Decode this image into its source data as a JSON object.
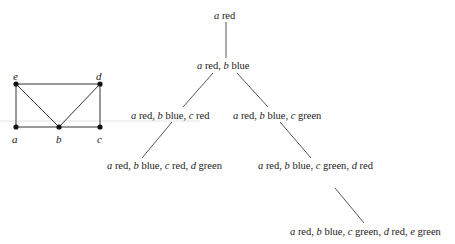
{
  "graph": {
    "vertices": [
      {
        "id": "e",
        "label": "e",
        "x": 16,
        "y": 84
      },
      {
        "id": "d",
        "label": "d",
        "x": 100,
        "y": 84
      },
      {
        "id": "a",
        "label": "a",
        "x": 16,
        "y": 127
      },
      {
        "id": "b",
        "label": "b",
        "x": 59,
        "y": 127
      },
      {
        "id": "c",
        "label": "c",
        "x": 100,
        "y": 127
      }
    ],
    "edges": [
      [
        "e",
        "d"
      ],
      [
        "e",
        "a"
      ],
      [
        "e",
        "b"
      ],
      [
        "d",
        "b"
      ],
      [
        "d",
        "c"
      ],
      [
        "a",
        "b"
      ],
      [
        "b",
        "c"
      ]
    ]
  },
  "tree": {
    "nodes": [
      {
        "id": "n0",
        "label": "a red",
        "parts": [
          [
            "a",
            "red"
          ]
        ]
      },
      {
        "id": "n1",
        "label": "a red, b blue",
        "parts": [
          [
            "a",
            "red"
          ],
          [
            "b",
            "blue"
          ]
        ]
      },
      {
        "id": "n2",
        "label": "a red, b blue, c red",
        "parts": [
          [
            "a",
            "red"
          ],
          [
            "b",
            "blue"
          ],
          [
            "c",
            "red"
          ]
        ]
      },
      {
        "id": "n3",
        "label": "a red, b blue, c green",
        "parts": [
          [
            "a",
            "red"
          ],
          [
            "b",
            "blue"
          ],
          [
            "c",
            "green"
          ]
        ]
      },
      {
        "id": "n4",
        "label": "a red, b blue, c red, d green",
        "parts": [
          [
            "a",
            "red"
          ],
          [
            "b",
            "blue"
          ],
          [
            "c",
            "red"
          ],
          [
            "d",
            "green"
          ]
        ]
      },
      {
        "id": "n5",
        "label": "a red, b blue, c green, d red",
        "parts": [
          [
            "a",
            "red"
          ],
          [
            "b",
            "blue"
          ],
          [
            "c",
            "green"
          ],
          [
            "d",
            "red"
          ]
        ]
      },
      {
        "id": "n6",
        "label": "a red, b blue, c green, d red, e green",
        "parts": [
          [
            "a",
            "red"
          ],
          [
            "b",
            "blue"
          ],
          [
            "c",
            "green"
          ],
          [
            "d",
            "red"
          ],
          [
            "e",
            "green"
          ]
        ]
      }
    ],
    "edges": [
      [
        "n0",
        "n1"
      ],
      [
        "n1",
        "n2"
      ],
      [
        "n1",
        "n3"
      ],
      [
        "n2",
        "n4"
      ],
      [
        "n3",
        "n5"
      ],
      [
        "n5",
        "n6"
      ]
    ]
  }
}
